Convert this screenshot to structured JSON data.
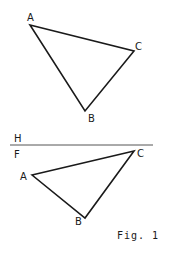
{
  "figure": {
    "caption": "Fig. 1",
    "colors": {
      "line": "#1a1a1a",
      "ground_line": "#555555",
      "background": "#ffffff"
    },
    "top_view": {
      "labels": {
        "A": "A",
        "B": "B",
        "C": "C"
      },
      "vertices": {
        "A": [
          30,
          25
        ],
        "B": [
          85,
          111
        ],
        "C": [
          134,
          51
        ]
      }
    },
    "fold_line": {
      "label_above": "H",
      "label_below": "F",
      "y": 145,
      "x_start": 10,
      "x_end": 153
    },
    "front_view": {
      "labels": {
        "A": "A",
        "B": "B",
        "C": "C"
      },
      "vertices": {
        "A": [
          32,
          175
        ],
        "B": [
          85,
          218
        ],
        "C": [
          134,
          151
        ]
      }
    }
  }
}
